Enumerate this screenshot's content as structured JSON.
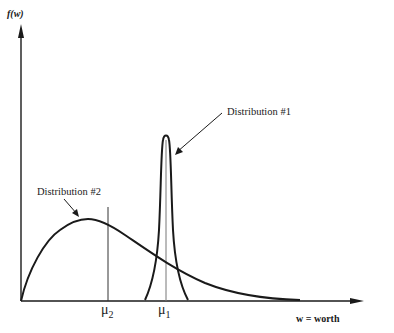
{
  "figure": {
    "y_axis_label": "f(w)",
    "x_axis_label": "w = worth",
    "distribution_1_label": "Distribution #1",
    "distribution_2_label": "Distribution #2",
    "mu_1_symbol": "μ",
    "mu_1_sub": "1",
    "mu_2_symbol": "μ",
    "mu_2_sub": "2",
    "line_color": "#1a1a1a",
    "mean_line_color": "#555555"
  }
}
